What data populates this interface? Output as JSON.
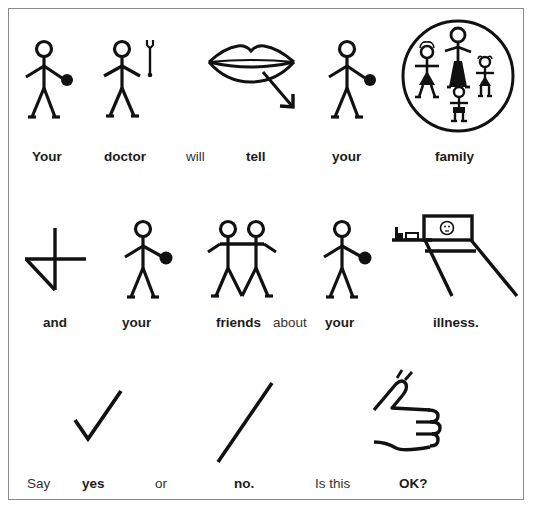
{
  "document": {
    "type": "symbol-supported easy-read sentence card",
    "border_color": "#8a8a8a",
    "ink_color": "#111111"
  },
  "rows": [
    {
      "id": "row1",
      "words": [
        {
          "text": "Your",
          "bold": true,
          "symbol": "person-pointing-self-icon"
        },
        {
          "text": "doctor",
          "bold": true,
          "symbol": "doctor-stethoscope-icon"
        },
        {
          "text": "will",
          "bold": false,
          "symbol": null
        },
        {
          "text": "tell",
          "bold": true,
          "symbol": "lips-speaking-arrow-icon"
        },
        {
          "text": "your",
          "bold": true,
          "symbol": "person-pointing-self-icon"
        },
        {
          "text": "family",
          "bold": true,
          "symbol": "family-circle-icon"
        }
      ]
    },
    {
      "id": "row2",
      "words": [
        {
          "text": "and",
          "bold": true,
          "symbol": "and-plus-triangle-icon"
        },
        {
          "text": "your",
          "bold": true,
          "symbol": "person-pointing-self-icon"
        },
        {
          "text": "friends",
          "bold": true,
          "symbol": "two-friends-arms-linked-icon"
        },
        {
          "text": "about",
          "bold": false,
          "symbol": null
        },
        {
          "text": "your",
          "bold": true,
          "symbol": "person-pointing-self-icon"
        },
        {
          "text": "illness.",
          "bold": true,
          "symbol": "sick-person-in-bed-icon"
        }
      ]
    },
    {
      "id": "row3",
      "words": [
        {
          "text": "Say",
          "bold": false,
          "symbol": null
        },
        {
          "text": "yes",
          "bold": true,
          "symbol": "check-mark-icon"
        },
        {
          "text": "or",
          "bold": false,
          "symbol": null
        },
        {
          "text": "no.",
          "bold": true,
          "symbol": "slash-no-icon"
        },
        {
          "text": "Is this",
          "bold": false,
          "symbol": null
        },
        {
          "text": "OK?",
          "bold": true,
          "symbol": "thumbs-up-icon"
        }
      ]
    }
  ]
}
